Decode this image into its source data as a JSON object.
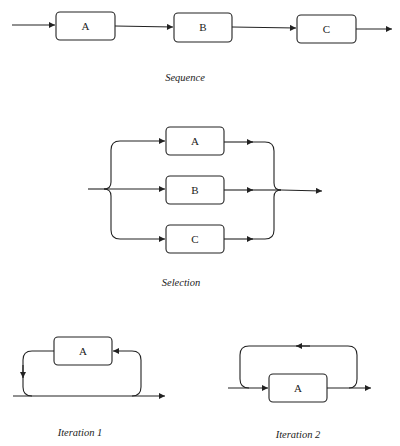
{
  "diagrams": {
    "sequence": {
      "caption": "Sequence",
      "boxes": [
        {
          "label": "A"
        },
        {
          "label": "B"
        },
        {
          "label": "C"
        }
      ]
    },
    "selection": {
      "caption": "Selection",
      "boxes": [
        {
          "label": "A"
        },
        {
          "label": "B"
        },
        {
          "label": "C"
        }
      ]
    },
    "iteration1": {
      "caption": "Iteration 1",
      "box": {
        "label": "A"
      }
    },
    "iteration2": {
      "caption": "Iteration 2",
      "box": {
        "label": "A"
      }
    }
  },
  "colors": {
    "stroke": "#222222",
    "background": "#ffffff"
  }
}
